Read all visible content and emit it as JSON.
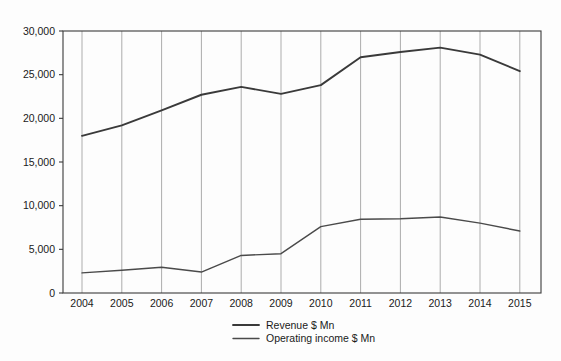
{
  "chart_data": {
    "type": "line",
    "title": "",
    "subtitle": "",
    "xlabel": "",
    "ylabel": "",
    "categories": [
      "2004",
      "2005",
      "2006",
      "2007",
      "2008",
      "2009",
      "2010",
      "2011",
      "2012",
      "2013",
      "2014",
      "2015"
    ],
    "series": [
      {
        "name": "Revenue $ Mn",
        "color": "#3a3a3a",
        "values": [
          18000,
          19200,
          20900,
          22700,
          23600,
          22800,
          23800,
          27000,
          27600,
          28100,
          27300,
          25400
        ]
      },
      {
        "name": "Operating income $ Mn",
        "color": "#4a4a4a",
        "values": [
          2300,
          2600,
          2950,
          2400,
          4300,
          4500,
          7600,
          8450,
          8500,
          8700,
          8000,
          7100
        ]
      }
    ],
    "ylim": [
      0,
      30000
    ],
    "yticks": [
      0,
      5000,
      10000,
      15000,
      20000,
      25000,
      30000
    ],
    "ytick_labels": [
      "0",
      "5,000",
      "10,000",
      "15,000",
      "20,000",
      "25,000",
      "30,000"
    ],
    "xtick_labels": [
      "2004",
      "2005",
      "2006",
      "2007",
      "2008",
      "2009",
      "2010",
      "2011",
      "2012",
      "2013",
      "2014",
      "2015"
    ],
    "grid": {
      "vertical": true,
      "horizontal": false,
      "color": "#8a8a8a"
    },
    "legend": {
      "position": "bottom-center",
      "entries": [
        {
          "label": "Revenue $ Mn",
          "color": "#3a3a3a"
        },
        {
          "label": "Operating income $ Mn",
          "color": "#4a4a4a"
        }
      ]
    },
    "plot_area": {
      "left": 63,
      "right": 541,
      "top": 31,
      "bottom": 293
    },
    "background_color": "#fdfdfd",
    "axis_color": "#3b3b3b"
  }
}
